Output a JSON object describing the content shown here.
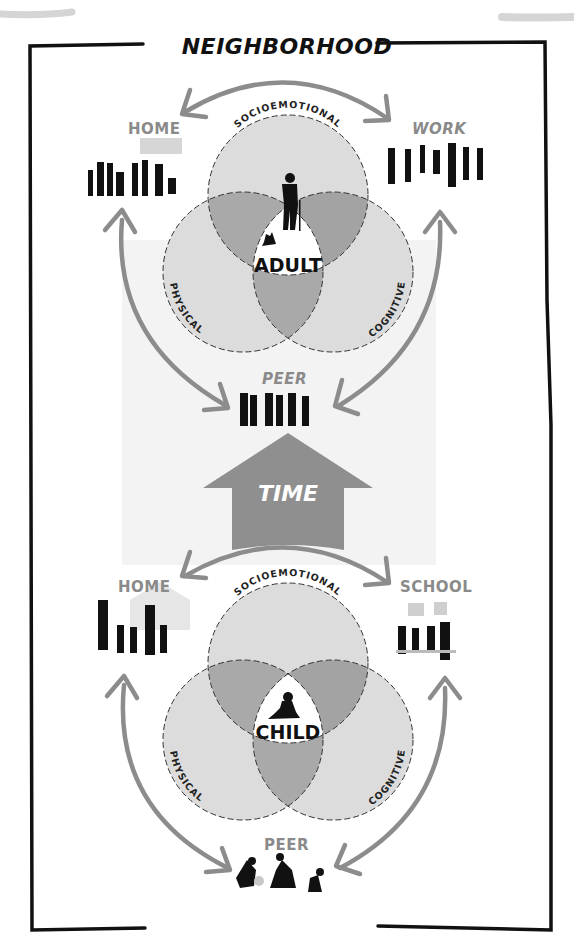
{
  "title": "NEIGHBORHOOD",
  "center_arrow": {
    "label": "TIME",
    "direction": "up"
  },
  "adult_diagram": {
    "center_label": "ADULT",
    "domains": [
      "SOCIOEMOTIONAL",
      "PHYSICAL",
      "COGNITIVE"
    ],
    "contexts": {
      "top_left": "HOME",
      "top_right": "WORK",
      "bottom": "PEER"
    },
    "center_icon": "elderly-man-with-cane-and-dog"
  },
  "child_diagram": {
    "center_label": "CHILD",
    "domains": [
      "SOCIOEMOTIONAL",
      "PHYSICAL",
      "COGNITIVE"
    ],
    "contexts": {
      "top_left": "HOME",
      "top_right": "SCHOOL",
      "bottom": "PEER"
    },
    "center_icon": "crawling-baby"
  },
  "colors": {
    "circle_fill": "#dcdcdc",
    "overlap_fill": "#a9a9a9",
    "center_fill": "#ffffff",
    "arrow": "#8c8c8c",
    "time_arrow": "#8f8f8f",
    "border": "#111111",
    "context_label": "#8a8a8a",
    "band": "#f2f2f2"
  }
}
